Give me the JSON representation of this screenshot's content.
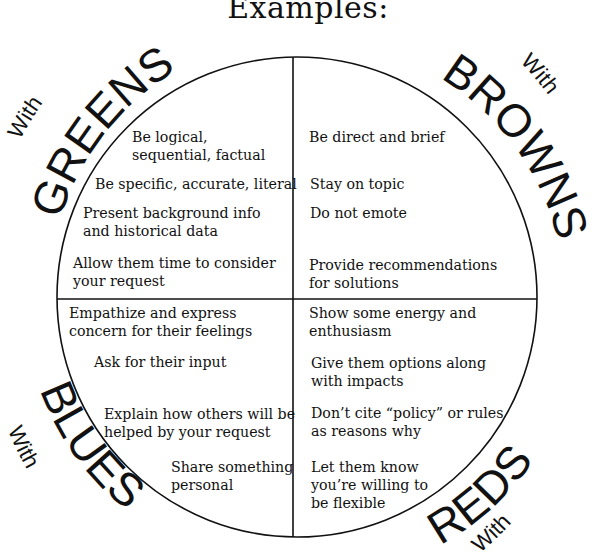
{
  "title": "Examples:",
  "quadrants": {
    "greens": {
      "prefix": "With",
      "label": "GREENS",
      "tips": [
        {
          "line1": "Be logical,",
          "line2": "sequential, factual"
        },
        {
          "line1": "Be specific, accurate, literal",
          "line2": ""
        },
        {
          "line1": "Present background info",
          "line2": "and historical data"
        },
        {
          "line1": "Allow them time to consider",
          "line2": "your request"
        }
      ]
    },
    "browns": {
      "prefix": "With",
      "label": "BROWNS",
      "tips": [
        {
          "line1": "Be direct and brief",
          "line2": ""
        },
        {
          "line1": "Stay on topic",
          "line2": ""
        },
        {
          "line1": "Do not emote",
          "line2": ""
        },
        {
          "line1": "Provide recommendations",
          "line2": "for solutions"
        }
      ]
    },
    "blues": {
      "prefix": "With",
      "label": "BLUES",
      "tips": [
        {
          "line1": "Empathize and express",
          "line2": "concern for their feelings"
        },
        {
          "line1": "Ask for their input",
          "line2": ""
        },
        {
          "line1": "Explain how others will be",
          "line2": "helped by your request"
        },
        {
          "line1": "Share something",
          "line2": "personal"
        }
      ]
    },
    "reds": {
      "prefix": "With",
      "label": "REDS",
      "tips": [
        {
          "line1": "Show some energy and",
          "line2": "enthusiasm"
        },
        {
          "line1": "Give them options along",
          "line2": "with impacts"
        },
        {
          "line1": "Don’t cite “policy” or rules",
          "line2": "as reasons why"
        },
        {
          "line1": "Let them know",
          "line2": "you’re willing to"
        },
        {
          "line1": "be flexible",
          "line2": ""
        }
      ]
    }
  },
  "colors": {
    "ink": "#111111",
    "background": "#ffffff"
  }
}
